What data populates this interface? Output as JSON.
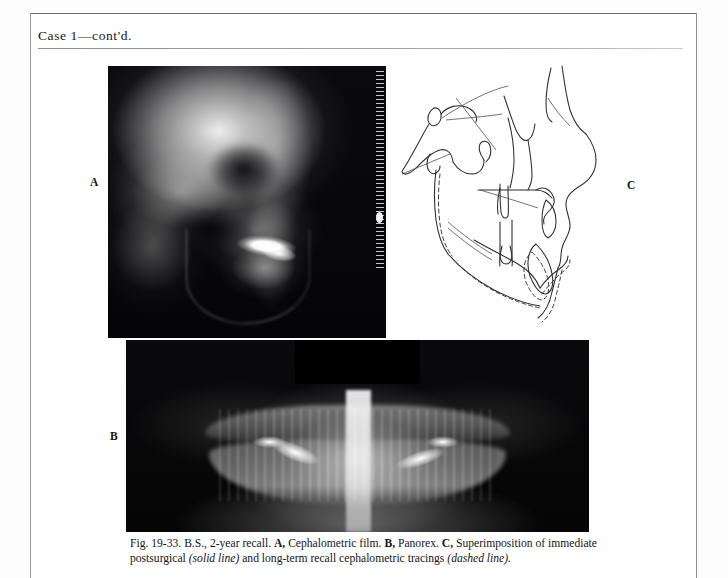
{
  "page": {
    "running_head": "Case 1—cont'd."
  },
  "figure": {
    "panels": [
      {
        "letter": "A",
        "name": "cephalometric-film",
        "kind": "radiograph",
        "description": "Lateral cephalometric film"
      },
      {
        "letter": "B",
        "name": "panorex",
        "kind": "radiograph",
        "description": "Panoramic radiograph (Panorex)"
      },
      {
        "letter": "C",
        "name": "cephalometric-tracing",
        "kind": "line-tracing",
        "description": "Superimposition of immediate postsurgical and long-term recall cephalometric tracings"
      }
    ],
    "caption": {
      "figure_number": "Fig. 19-33.",
      "subject": "B.S., 2-year recall.",
      "part_a_label": "A,",
      "part_a_text": "Cephalometric film.",
      "part_b_label": "B,",
      "part_b_text": "Panorex.",
      "part_c_label": "C,",
      "part_c_text_1": "Superimposition of immediate postsurgical",
      "part_c_emphasis_1": "(solid line)",
      "part_c_text_2": "and long-term recall cephalometric tracings",
      "part_c_emphasis_2": "(dashed line).",
      "full_text": "Fig. 19-33. B.S., 2-year recall. A, Cephalometric film. B, Panorex. C, Superimposition of immediate postsurgical (solid line) and long-term recall cephalometric tracings (dashed line)."
    }
  },
  "colors": {
    "paper": "#ffffff",
    "ink": "#151515",
    "rule": "#8e8e8e",
    "border": "#9a9a9a",
    "film_black": "#050506",
    "tracing_stroke": "#2b2b33"
  }
}
